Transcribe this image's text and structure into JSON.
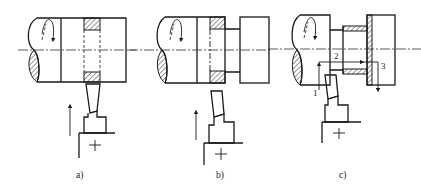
{
  "figure": {
    "panels": [
      {
        "id": "a",
        "label": "a)"
      },
      {
        "id": "b",
        "label": "b)"
      },
      {
        "id": "c",
        "label": "c)",
        "step_labels": [
          "1",
          "2",
          "3"
        ]
      }
    ]
  },
  "colors": {
    "line": "#1a1a1a",
    "background": "#ffffff"
  }
}
